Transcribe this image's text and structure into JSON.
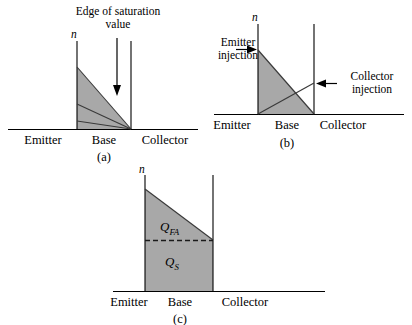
{
  "figure": {
    "type": "scientific-diagram",
    "background_color": "#ffffff",
    "ink_color": "#000000",
    "shade_color": "#a8a8a8",
    "shade_color_light": "#bdbdbd",
    "width": 412,
    "height": 325
  },
  "panels": [
    {
      "id": "a",
      "caption": "(a)",
      "axis_symbol": "n",
      "regions": {
        "emitter": "Emitter",
        "base": "Base",
        "collector": "Collector"
      },
      "annotations": [
        {
          "name": "edge-of-saturation",
          "line1": "Edge of saturation",
          "line2": "value",
          "arrow": "down"
        }
      ],
      "profiles": [
        {
          "name": "upper-profile",
          "description": "largest triangle, high injection near edge of saturation"
        },
        {
          "name": "middle-profile",
          "description": "intermediate triangle"
        },
        {
          "name": "lower-profile",
          "description": "smallest triangle, low injection"
        }
      ]
    },
    {
      "id": "b",
      "caption": "(b)",
      "axis_symbol": "n",
      "regions": {
        "emitter": "Emitter",
        "base": "Base",
        "collector": "Collector"
      },
      "annotations": [
        {
          "name": "emitter-injection",
          "line1": "Emitter",
          "line2": "injection",
          "arrow": "right"
        },
        {
          "name": "collector-injection",
          "line1": "Collector",
          "line2": "injection",
          "arrow": "left"
        }
      ],
      "profiles": [
        {
          "name": "emitter-injection-profile",
          "description": "descending line from emitter edge top to collector edge bottom"
        },
        {
          "name": "collector-injection-profile",
          "description": "ascending line from emitter edge bottom to collector edge mid-height"
        }
      ]
    },
    {
      "id": "c",
      "caption": "(c)",
      "axis_symbol": "n",
      "regions": {
        "emitter": "Emitter",
        "base": "Base",
        "collector": "Collector"
      },
      "charges": [
        {
          "name": "forward-active-charge",
          "symbol": "Q",
          "subscript": "FA"
        },
        {
          "name": "saturation-charge",
          "symbol": "Q",
          "subscript": "S"
        }
      ],
      "annotations": [
        {
          "name": "charge-divider",
          "style": "dashed-horizontal"
        }
      ]
    }
  ]
}
